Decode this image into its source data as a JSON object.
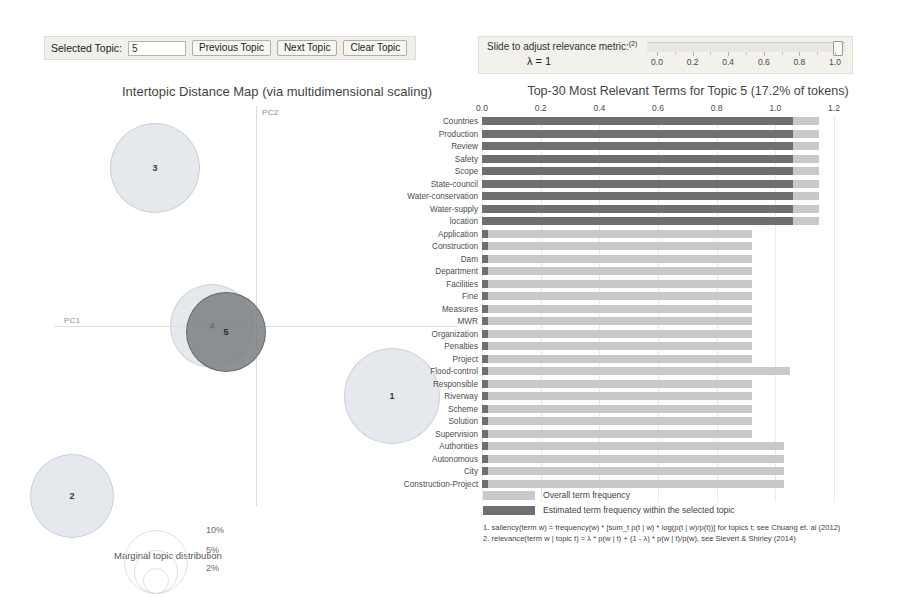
{
  "controls": {
    "selected_topic_label": "Selected Topic:",
    "selected_topic_value": "5",
    "previous_topic": "Previous Topic",
    "next_topic": "Next Topic",
    "clear_topic": "Clear Topic"
  },
  "lambda_panel": {
    "title": "Slide to adjust relevance metric:",
    "title_sup": "(2)",
    "lambda_value": "λ = 1",
    "ticks": [
      {
        "label": "0.0",
        "value": 0.0
      },
      {
        "label": "0.2",
        "value": 0.2
      },
      {
        "label": "0.4",
        "value": 0.4
      },
      {
        "label": "0.6",
        "value": 0.6
      },
      {
        "label": "0.8",
        "value": 0.8
      },
      {
        "label": "1.0",
        "value": 1.0
      }
    ],
    "handle_position": 1.0
  },
  "mds": {
    "title": "Intertopic Distance Map (via multidimensional scaling)",
    "axis_x_label": "PC1",
    "axis_y_label": "PC2",
    "topics": [
      {
        "id": "3",
        "cx": 105,
        "cy": 64,
        "r": 45,
        "selected": false
      },
      {
        "id": "4",
        "cx": 162,
        "cy": 222,
        "r": 42,
        "selected": false
      },
      {
        "id": "5",
        "cx": 176,
        "cy": 228,
        "r": 40,
        "selected": true
      },
      {
        "id": "1",
        "cx": 342,
        "cy": 292,
        "r": 48,
        "selected": false
      },
      {
        "id": "2",
        "cx": 22,
        "cy": 392,
        "r": 42,
        "selected": false
      }
    ],
    "marginal_label": "Marginal topic distribution",
    "reference_circles": [
      {
        "label": "2%",
        "r": 13
      },
      {
        "label": "5%",
        "r": 22
      },
      {
        "label": "10%",
        "r": 32
      }
    ]
  },
  "barchart": {
    "title": "Top-30 Most Relevant Terms for Topic 5 (17.2% of tokens)",
    "legend": [
      {
        "swatch": "overall",
        "text": "Overall term frequency"
      },
      {
        "swatch": "topic",
        "text": "Estimated term frequency within the selected topic"
      }
    ],
    "footnotes": [
      "1. saliency(term w) = frequency(w) * [sum_t p(t | w) * log(p(t | w)/p(t))] for topics t; see Chuang et. al (2012)",
      "2. relevance(term w | topic t) = λ * p(w | t) + (1 - λ) * p(w | t)/p(w), see Sievert & Shirley (2014)"
    ]
  },
  "chart_data": {
    "type": "bar",
    "title": "Top-30 Most Relevant Terms for Topic 5 (17.2% of tokens)",
    "xlabel": "",
    "ylabel": "",
    "xlim": [
      0.0,
      1.2
    ],
    "grid": true,
    "orientation": "horizontal",
    "legend_position": "bottom-left",
    "xticks": [
      0.0,
      0.2,
      0.4,
      0.6,
      0.8,
      1.0,
      1.2
    ],
    "xtick_labels": [
      "0.0",
      "0.2",
      "0.4",
      "0.6",
      "0.8",
      "1.0",
      "1.2"
    ],
    "categories": [
      "Countries",
      "Production",
      "Review",
      "Safety",
      "Scope",
      "State-council",
      "Water-conservation",
      "Water-supply",
      "location",
      "Application",
      "Construction",
      "Dam",
      "Department",
      "Facilities",
      "Fine",
      "Measures",
      "MWR",
      "Organization",
      "Penalties",
      "Project",
      "Flood-control",
      "Responsible",
      "Riverway",
      "Scheme",
      "Solution",
      "Supervision",
      "Authorities",
      "Autonomous",
      "City",
      "Construction-Project"
    ],
    "series": [
      {
        "name": "Overall term frequency",
        "color": "#c9c9c9",
        "values": [
          1.15,
          1.15,
          1.15,
          1.15,
          1.15,
          1.15,
          1.15,
          1.15,
          1.15,
          0.92,
          0.92,
          0.92,
          0.92,
          0.92,
          0.92,
          0.92,
          0.92,
          0.92,
          0.92,
          0.92,
          1.05,
          0.92,
          0.92,
          0.92,
          0.92,
          0.92,
          1.03,
          1.03,
          1.03,
          1.03
        ]
      },
      {
        "name": "Estimated term frequency within the selected topic",
        "color": "#6f6f6f",
        "values": [
          1.06,
          1.06,
          1.06,
          1.06,
          1.06,
          1.06,
          1.06,
          1.06,
          1.06,
          0.022,
          0.022,
          0.022,
          0.022,
          0.022,
          0.022,
          0.022,
          0.022,
          0.022,
          0.022,
          0.022,
          0.022,
          0.022,
          0.022,
          0.022,
          0.022,
          0.022,
          0.022,
          0.022,
          0.022,
          0.022
        ]
      }
    ]
  }
}
